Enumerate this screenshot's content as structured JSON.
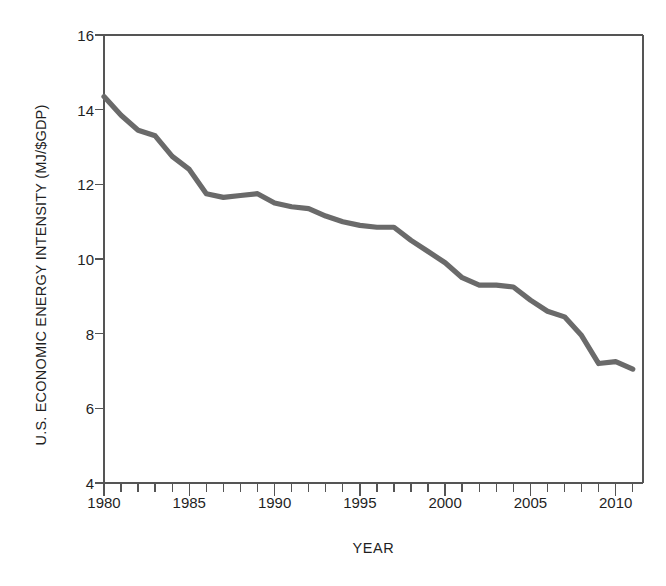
{
  "chart_data": {
    "type": "line",
    "title": "",
    "xlabel": "YEAR",
    "ylabel": "U.S. ECONOMIC ENERGY INTENSITY (MJ/$GDP)",
    "xlim": [
      1980,
      2011.6
    ],
    "ylim": [
      4,
      16
    ],
    "ytick_values": [
      4,
      6,
      8,
      10,
      12,
      14,
      16
    ],
    "ytick_labels": [
      "4",
      "6",
      "8",
      "10",
      "12",
      "14",
      "16"
    ],
    "xtick_values": [
      1980,
      1985,
      1990,
      1995,
      2000,
      2005,
      2010
    ],
    "xtick_labels": [
      "1980",
      "1985",
      "1990",
      "1995",
      "2000",
      "2005",
      "2010"
    ],
    "xminor_step": 1,
    "grid": false,
    "legend": null,
    "legend_position": "none",
    "line_color": "#6a6a6a",
    "line_width": 5.2,
    "axis_color": "#555555",
    "frame": "full-box",
    "x": [
      1980,
      1981,
      1982,
      1983,
      1984,
      1985,
      1986,
      1987,
      1988,
      1989,
      1990,
      1991,
      1992,
      1993,
      1994,
      1995,
      1996,
      1997,
      1998,
      1999,
      2000,
      2001,
      2002,
      2003,
      2004,
      2005,
      2006,
      2007,
      2008,
      2009,
      2010,
      2011
    ],
    "values": [
      14.35,
      13.85,
      13.45,
      13.3,
      12.75,
      12.4,
      11.75,
      11.65,
      11.7,
      11.75,
      11.5,
      11.4,
      11.35,
      11.15,
      11.0,
      10.9,
      10.85,
      10.85,
      10.5,
      10.2,
      9.9,
      9.5,
      9.3,
      9.3,
      9.25,
      8.9,
      8.6,
      8.45,
      7.95,
      7.2,
      7.25,
      7.05
    ],
    "series_name": "U.S. economic energy intensity",
    "units": "MJ per dollar of GDP",
    "annotations": []
  },
  "figure": {
    "background_color": "#ffffff",
    "plot_left_px": 104,
    "plot_right_px": 643,
    "plot_top_px": 35,
    "plot_bottom_px": 483
  }
}
